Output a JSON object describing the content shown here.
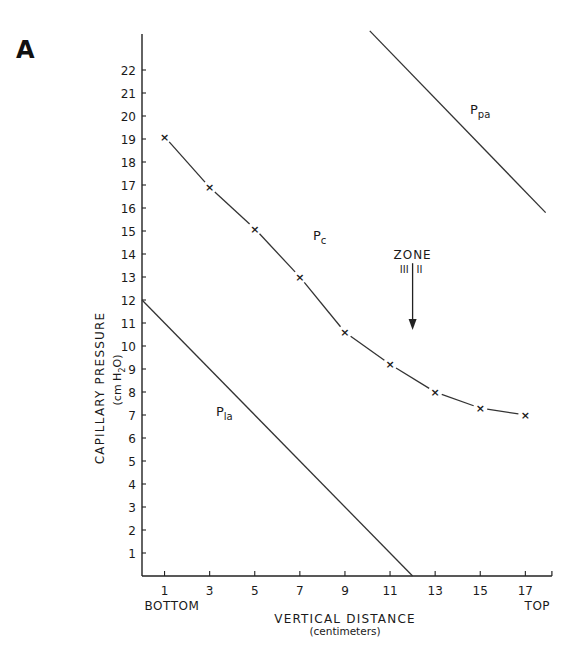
{
  "panel_label": "A",
  "chart_data": {
    "type": "line",
    "title": "",
    "panel": "A",
    "xlabel": "VERTICAL DISTANCE",
    "xlabel_sub": "(centimeters)",
    "ylabel": "CAPILLARY PRESSURE",
    "ylabel_sub": "(cm H2O)",
    "x_ticks": [
      1,
      3,
      5,
      7,
      9,
      11,
      13,
      15,
      17
    ],
    "y_ticks": [
      1,
      2,
      3,
      4,
      5,
      6,
      7,
      8,
      9,
      10,
      11,
      12,
      13,
      14,
      15,
      16,
      17,
      18,
      19,
      20,
      21,
      22
    ],
    "x_end_labels": {
      "left": "BOTTOM",
      "right": "TOP"
    },
    "xlim": [
      0,
      18
    ],
    "ylim": [
      0,
      24
    ],
    "grid": false,
    "legend": "none (inline curve labels)",
    "series": [
      {
        "name": "Pc",
        "label_main": "P",
        "label_sub": "c",
        "style": "line with x markers",
        "x": [
          1,
          3,
          5,
          7,
          9,
          11,
          13,
          15,
          17
        ],
        "y": [
          19.1,
          16.9,
          15.1,
          13.0,
          10.6,
          9.2,
          8.0,
          7.3,
          7.0
        ]
      },
      {
        "name": "Ppa",
        "label_main": "P",
        "label_sub": "pa",
        "style": "straight line",
        "x": [
          10.1,
          17.9
        ],
        "y": [
          23.7,
          15.8
        ]
      },
      {
        "name": "Pla",
        "label_main": "P",
        "label_sub": "la",
        "style": "straight line",
        "x": [
          0,
          12
        ],
        "y": [
          12,
          0
        ]
      }
    ],
    "annotations": [
      {
        "text": "ZONE",
        "left_text": "III",
        "right_text": "II",
        "type": "downward arrow",
        "x": 12,
        "y_from": 13.6,
        "y_to": 10.7
      }
    ]
  }
}
